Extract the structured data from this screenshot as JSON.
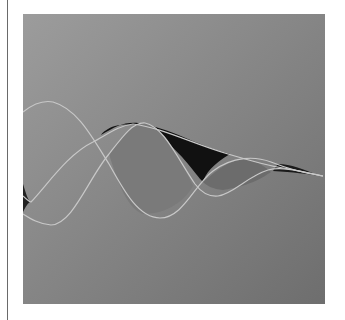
{
  "artwork": {
    "description": "Abstract grey gradient square with three intertwined damped wave ribbons",
    "colors": {
      "gradient_start": "#9c9c9c",
      "gradient_end": "#6e6e6e",
      "stroke": "#c8c8c8",
      "fill_dark": "#111111",
      "fill_mid": "#7e7e7e",
      "fill_light": "#8e8e8e"
    }
  }
}
